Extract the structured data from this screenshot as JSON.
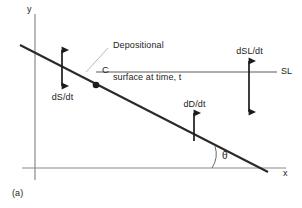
{
  "figure": {
    "caption": "(a)",
    "axes": {
      "y_label": "y",
      "x_label": "x"
    },
    "annotations": {
      "callout": "Depositional\nsurface at time, t",
      "callout_line1": "Depositional",
      "callout_line2": "surface at time, t",
      "point_c": "C",
      "sea_level": "SL",
      "subsidence_rate": "dS/dt",
      "deposition_rate": "dD/dt",
      "sealevel_rate": "dSL/dt",
      "angle": "θ"
    },
    "colors": {
      "background": "#ffffff",
      "stroke": "#3a3a3a",
      "heavy_stroke": "#1c1c1c",
      "leader": "#b0b0b0",
      "text": "#1c1c1c"
    },
    "geometry": {
      "x_axis_y": 168,
      "y_axis_x": 35,
      "sl_line_y": 72,
      "surface_start": [
        20,
        45
      ],
      "surface_end": [
        268,
        172
      ],
      "point_c_xy": [
        96,
        84
      ]
    }
  }
}
